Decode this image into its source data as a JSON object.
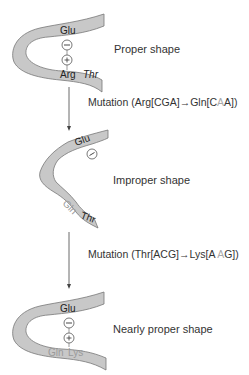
{
  "stages": [
    {
      "label": "Proper shape",
      "top_residue": "Glu",
      "top_charge": "−",
      "bottom_charge": "+",
      "bottom_residues": [
        "Arg",
        "Thr"
      ]
    },
    {
      "label": "Improper shape",
      "top_residue": "Glu",
      "top_charge": "−",
      "bottom_residues": [
        "Gln",
        "Thr"
      ]
    },
    {
      "label": "Nearly proper shape",
      "top_residue": "Glu",
      "top_charge": "−",
      "bottom_charge": "+",
      "bottom_residues": [
        "Gln",
        "Lys"
      ]
    }
  ],
  "mutations": [
    {
      "prefix": "Mutation (Arg[CGA]",
      "arrow": "→",
      "suffix_before": "Gln[C",
      "highlight": "A",
      "suffix_after": "A])"
    },
    {
      "prefix": "Mutation (Thr[ACG]",
      "arrow": "→",
      "suffix_before": "Lys[A ",
      "highlight": "A",
      "suffix_after": "G])"
    }
  ],
  "colors": {
    "strand_fill": "#c8c8c8",
    "strand_stroke": "#777777",
    "text": "#333333",
    "highlight_text": "#aaaaaa"
  }
}
